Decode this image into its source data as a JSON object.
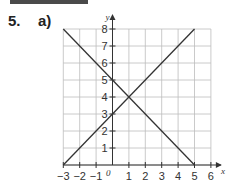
{
  "question": {
    "number": "5.",
    "part": "a)"
  },
  "chart_data": {
    "type": "line",
    "title": "",
    "xlabel": "x",
    "ylabel": "y",
    "xlim": [
      -3,
      6
    ],
    "ylim": [
      0,
      8
    ],
    "grid": true,
    "origin_label": "0",
    "x_ticks": [
      -3,
      -2,
      -1,
      1,
      2,
      3,
      4,
      5,
      6
    ],
    "x_tick_labels": [
      "−3",
      "−2",
      "−1",
      "1",
      "2",
      "3",
      "4",
      "5",
      "6"
    ],
    "y_ticks": [
      1,
      2,
      3,
      4,
      5,
      6,
      7,
      8
    ],
    "y_tick_labels": [
      "1",
      "2",
      "3",
      "4",
      "5",
      "6",
      "7",
      "8"
    ],
    "series": [
      {
        "name": "y = 5 - x",
        "points": [
          [
            -3,
            8
          ],
          [
            5,
            0
          ]
        ]
      },
      {
        "name": "y = x + 3",
        "points": [
          [
            -3,
            0
          ],
          [
            5,
            8
          ]
        ]
      }
    ],
    "intersection": [
      1,
      4
    ],
    "colors": {
      "line": "#333333",
      "grid": "#bdbdbd",
      "axis": "#333333"
    }
  }
}
